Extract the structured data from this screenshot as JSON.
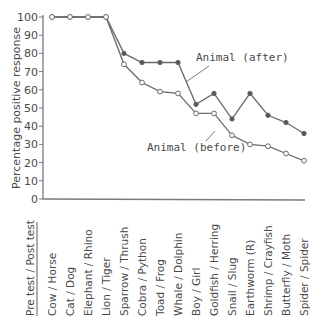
{
  "chart_data": {
    "type": "line",
    "title": "",
    "xlabel": "",
    "ylabel": "Percentage positive response",
    "ylim": [
      0,
      100
    ],
    "yticks": [
      0,
      10,
      20,
      30,
      40,
      50,
      60,
      70,
      80,
      90,
      100
    ],
    "grid": false,
    "header_label": "Pre test / Post test",
    "categories": [
      "Cow / Horse",
      "Cat / Dog",
      "Elephant / Rhino",
      "Lion / Tiger",
      "Sparrow / Thrush",
      "Cobra / Python",
      "Toad / Frog",
      "Whale / Dolphin",
      "Boy / Girl",
      "Goldfish / Herring",
      "Snail / Slug",
      "Earthworm (R)",
      "Shrimp / Crayfish",
      "Butterfly / Moth",
      "Spider / Spider"
    ],
    "series": [
      {
        "name": "Animal (after)",
        "marker": "filled-circle",
        "values": [
          100,
          100,
          100,
          100,
          80,
          75,
          75,
          75,
          52,
          58,
          44,
          58,
          46,
          42,
          36
        ]
      },
      {
        "name": "Animal (before)",
        "marker": "open-circle",
        "values": [
          100,
          100,
          100,
          100,
          74,
          64,
          59,
          58,
          47,
          47,
          35,
          30,
          29,
          25,
          21
        ]
      }
    ],
    "annotations": [
      {
        "text": "Animal (after)",
        "x": 196,
        "y": 61,
        "leader_from": [
          209,
          66
        ],
        "leader_to": [
          186,
          82
        ]
      },
      {
        "text": "Animal (before)",
        "x": 147,
        "y": 151,
        "leader_from": [
          206,
          141
        ],
        "leader_to": [
          215,
          131
        ]
      }
    ]
  },
  "colors": {
    "line": "#6a6a6a",
    "axis": "#7a7a7a",
    "text": "#4a4a4a"
  }
}
